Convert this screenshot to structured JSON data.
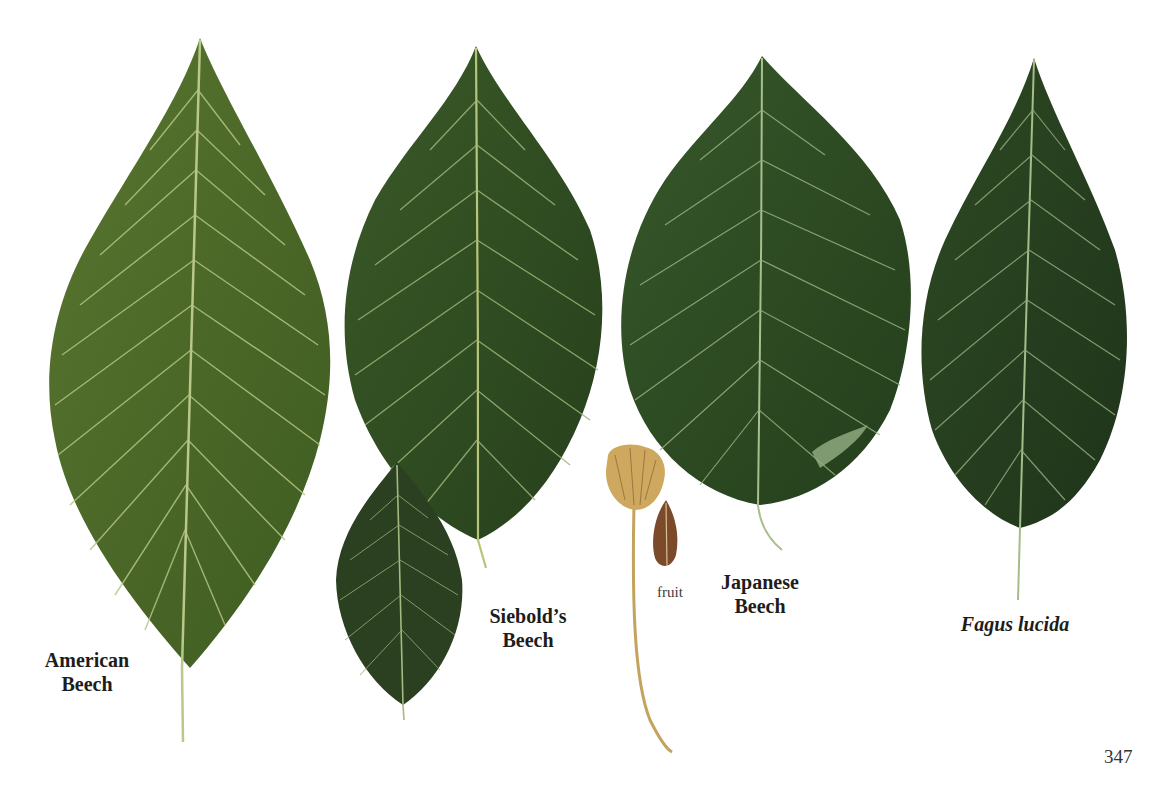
{
  "page": {
    "number": "347",
    "background": "#ffffff"
  },
  "illustrations": [
    {
      "id": "american-beech-leaf",
      "fill": "#4d6a2a",
      "vein": "#b9c98a"
    },
    {
      "id": "siebolds-beech-leaf-large",
      "fill": "#2f4a22",
      "vein": "#a9bd7a"
    },
    {
      "id": "siebolds-beech-leaf-small",
      "fill": "#2b3f21",
      "vein": "#9fb57a"
    },
    {
      "id": "beech-fruit",
      "fill": "#c9a35e",
      "nut": "#7a4a2a"
    },
    {
      "id": "japanese-beech-leaf",
      "fill": "#2f4e24",
      "vein": "#a0b88a"
    },
    {
      "id": "fagus-lucida-leaf",
      "fill": "#263d1f",
      "vein": "#9db584"
    }
  ],
  "labels": {
    "american": [
      "American",
      "Beech"
    ],
    "siebold": [
      "Siebold’s",
      "Beech"
    ],
    "fruit": "fruit",
    "japanese": [
      "Japanese",
      "Beech"
    ],
    "lucida": "Fagus lucida"
  }
}
